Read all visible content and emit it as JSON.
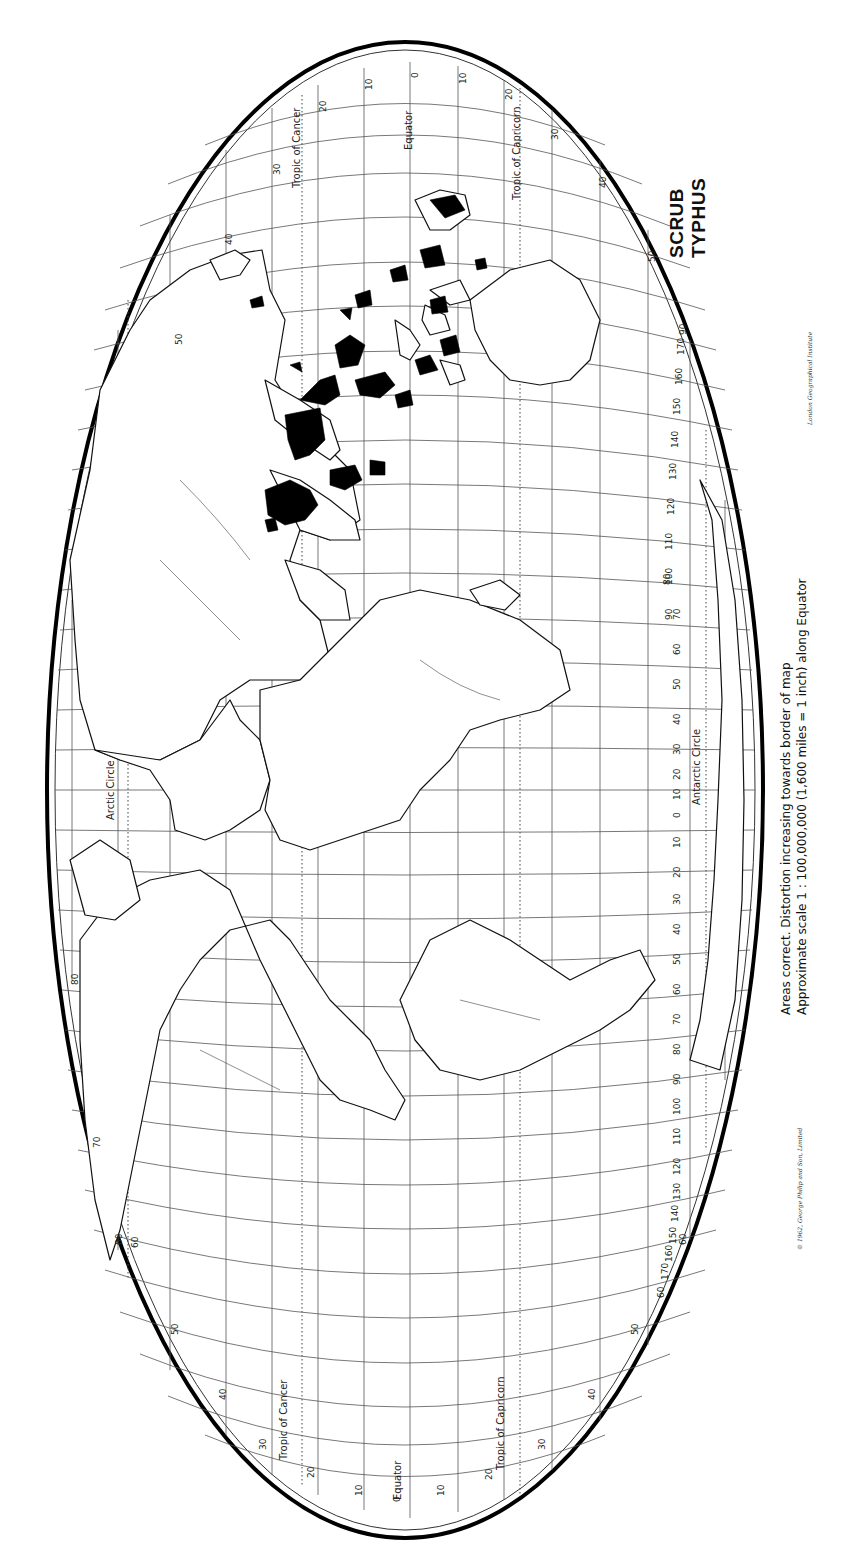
{
  "title": {
    "line1": "SCRUB",
    "line2": "TYPHUS"
  },
  "notes": {
    "line1": "Areas correct.   Distortion increasing towards border of map",
    "line2": "Approximate scale 1 : 100,000,000 (1,600 miles = 1 inch) along Equator"
  },
  "credits": {
    "copyright": "© 1962, George Philip and Son, Limited",
    "institute": "London Geographical Institute"
  },
  "map": {
    "projection": "equal-area oval (rotated 90° clockwise)",
    "legend_meaning": "Black areas = scrub typhus endemic regions",
    "colors": {
      "land_outline": "#111111",
      "endemic_fill": "#000000",
      "graticule": "#555555",
      "background": "#ffffff"
    },
    "parallels_labels": {
      "top": {
        "tropic_cancer": "Tropic of Cancer",
        "equator": "Equator",
        "tropic_capricorn": "Tropic of Capricorn",
        "arctic": "Arctic Circle",
        "antarctic": "Antarctic Circle"
      },
      "bottom": {
        "tropic_cancer": "Tropic of Cancer",
        "equator": "Equator",
        "tropic_capricorn": "Tropic of Capricorn"
      }
    },
    "latitude_ticks_top": [
      "60",
      "50",
      "40",
      "30",
      "20",
      "10",
      "0",
      "10",
      "20",
      "30",
      "40",
      "50"
    ],
    "latitude_ticks_bottom": [
      "80",
      "70",
      "60",
      "50",
      "40",
      "30",
      "20",
      "10",
      "0",
      "10",
      "20",
      "30",
      "40",
      "50",
      "60"
    ],
    "longitude_ticks_right": [
      "90",
      "170",
      "160",
      "150",
      "140",
      "130",
      "120",
      "110",
      "100",
      "90",
      "80",
      "70",
      "60",
      "50",
      "40",
      "30",
      "20",
      "10",
      "0",
      "10",
      "20",
      "30",
      "40",
      "50",
      "60",
      "70",
      "80",
      "90",
      "100",
      "110",
      "120",
      "130",
      "140",
      "150",
      "160",
      "170",
      "60"
    ],
    "polar_labels": [
      "70",
      "80",
      "70"
    ]
  }
}
